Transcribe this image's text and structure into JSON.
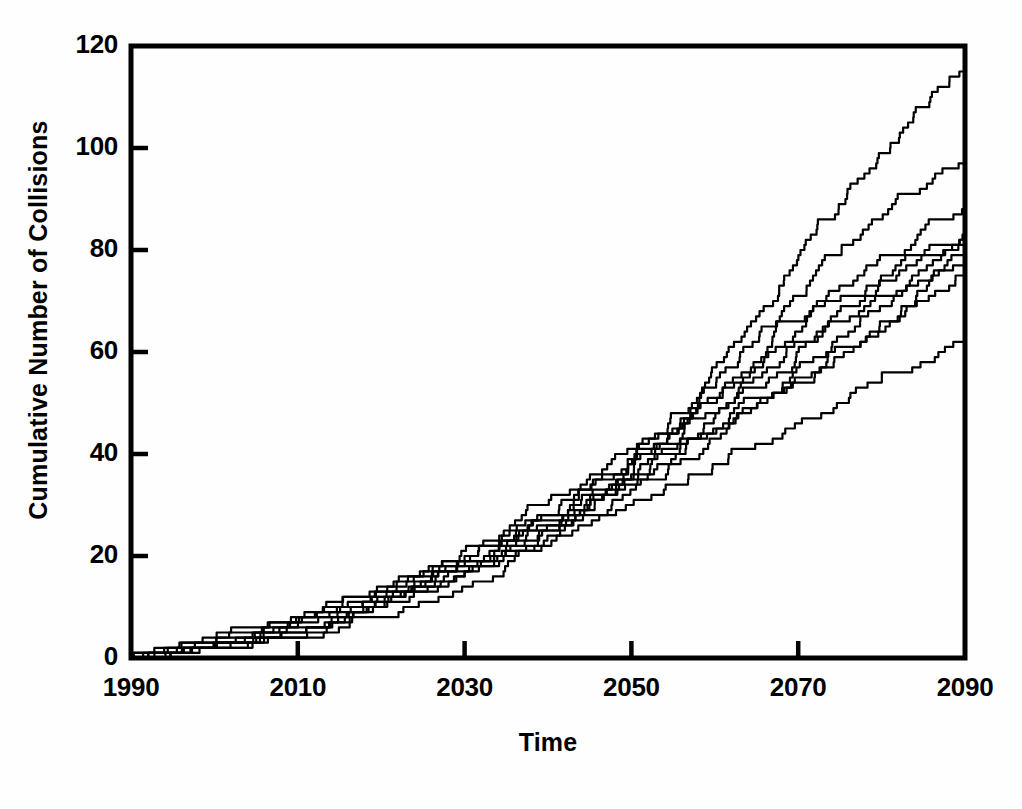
{
  "chart_data": {
    "type": "line",
    "title": "",
    "subtitle": "",
    "xlabel": "Time",
    "ylabel": "Cumulative Number of Collisions",
    "xlim": [
      1990,
      2090
    ],
    "ylim": [
      0,
      120
    ],
    "xticks": [
      1990,
      2010,
      2030,
      2050,
      2070,
      2090
    ],
    "xtick_labels": [
      "1990",
      "2010",
      "2030",
      "2050",
      "2070",
      "2090"
    ],
    "yticks": [
      0,
      20,
      40,
      60,
      80,
      100,
      120
    ],
    "ytick_labels": [
      "0",
      "20",
      "40",
      "60",
      "80",
      "100",
      "120"
    ],
    "grid": false,
    "legend": null,
    "legend_position": "none",
    "line_color": "#000000",
    "line_width": 2.2,
    "step_style": "post",
    "annotations": [],
    "x": [
      1990,
      1995,
      2000,
      2005,
      2010,
      2015,
      2020,
      2025,
      2030,
      2035,
      2040,
      2045,
      2050,
      2055,
      2060,
      2065,
      2070,
      2075,
      2080,
      2085,
      2090
    ],
    "series": [
      {
        "name": "run-1",
        "values": [
          0,
          2,
          4,
          6,
          8,
          11,
          14,
          17,
          21,
          25,
          30,
          35,
          41,
          48,
          57,
          67,
          78,
          89,
          99,
          108,
          115
        ]
      },
      {
        "name": "run-2",
        "values": [
          0,
          1,
          3,
          5,
          8,
          10,
          13,
          16,
          20,
          24,
          28,
          33,
          39,
          45,
          53,
          62,
          71,
          79,
          86,
          92,
          97
        ]
      },
      {
        "name": "run-3",
        "values": [
          0,
          1,
          2,
          4,
          6,
          9,
          12,
          15,
          19,
          23,
          27,
          32,
          38,
          44,
          51,
          58,
          66,
          73,
          79,
          84,
          88
        ]
      },
      {
        "name": "run-4",
        "values": [
          0,
          2,
          3,
          5,
          7,
          10,
          13,
          16,
          19,
          23,
          28,
          33,
          38,
          44,
          50,
          57,
          64,
          70,
          75,
          79,
          83
        ]
      },
      {
        "name": "run-5",
        "values": [
          0,
          1,
          2,
          4,
          6,
          8,
          11,
          14,
          18,
          22,
          26,
          31,
          36,
          42,
          48,
          55,
          62,
          68,
          74,
          79,
          82
        ]
      },
      {
        "name": "run-6",
        "values": [
          0,
          1,
          2,
          3,
          5,
          8,
          11,
          14,
          17,
          21,
          25,
          30,
          35,
          41,
          47,
          53,
          60,
          66,
          71,
          76,
          81
        ]
      },
      {
        "name": "run-7",
        "values": [
          0,
          2,
          3,
          5,
          7,
          9,
          12,
          15,
          18,
          22,
          26,
          30,
          35,
          40,
          45,
          51,
          57,
          63,
          69,
          74,
          79
        ]
      },
      {
        "name": "run-8",
        "values": [
          0,
          1,
          2,
          3,
          5,
          7,
          10,
          13,
          16,
          20,
          24,
          28,
          33,
          38,
          43,
          49,
          55,
          61,
          66,
          72,
          77
        ]
      },
      {
        "name": "run-9",
        "values": [
          0,
          1,
          2,
          3,
          4,
          7,
          10,
          13,
          17,
          21,
          25,
          29,
          34,
          39,
          44,
          49,
          54,
          59,
          64,
          70,
          76
        ]
      },
      {
        "name": "run-10",
        "values": [
          0,
          1,
          2,
          3,
          4,
          6,
          8,
          11,
          14,
          18,
          22,
          26,
          30,
          34,
          38,
          42,
          46,
          50,
          54,
          58,
          63
        ]
      }
    ],
    "series_count": 10
  },
  "axes": {
    "ylabel": "Cumulative Number of Collisions",
    "xlabel": "Time"
  }
}
